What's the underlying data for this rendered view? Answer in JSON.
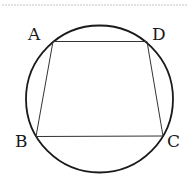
{
  "figure": {
    "type": "cyclic-quadrilateral",
    "vertices": [
      {
        "name": "A",
        "label": "A"
      },
      {
        "name": "D",
        "label": "D"
      },
      {
        "name": "B",
        "label": "B"
      },
      {
        "name": "C",
        "label": "C"
      }
    ],
    "segments": [
      "AD",
      "DC",
      "CB",
      "BA"
    ],
    "colors": {
      "stroke": "#1a1a1a",
      "separator": "#bbbbbb"
    }
  }
}
